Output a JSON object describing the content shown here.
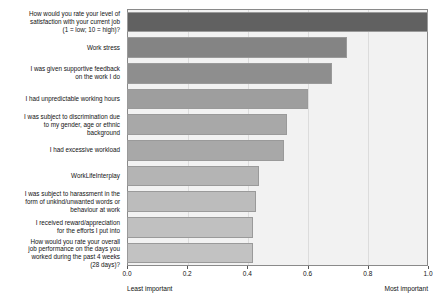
{
  "chart_data": {
    "type": "bar",
    "orientation": "horizontal",
    "title": "",
    "xlabel": "",
    "ylabel": "",
    "xlim": [
      0.0,
      1.0
    ],
    "xticks": [
      "0.0",
      "0.2",
      "0.4",
      "0.6",
      "0.8",
      "1.0"
    ],
    "xtick_values": [
      0.0,
      0.2,
      0.4,
      0.6,
      0.8,
      1.0
    ],
    "grid": true,
    "legend": "none",
    "axis_annotations": {
      "left": "Least important",
      "right": "Most important"
    },
    "categories": [
      "How would you rate your level of\nsatisfaction with your current job\n(1 = low; 10 = high)?",
      "Work stress",
      "I was given supportive feedback\non the work I do",
      "I had unpredictable working hours",
      "I was subject to discrimination due\nto my gender, age or ethnic\nbackground",
      "I had excessive workload",
      "WorkLifeInterplay",
      "I was subject to harassment in the\nform of unkind/unwanted words or\nbehaviour at work",
      "I received reward/appreciation\nfor the efforts I put into",
      "How would you rate your overall\njob performance on the days you\nworked during the past 4 weeks\n(28 days)?"
    ],
    "values": [
      1.0,
      0.73,
      0.68,
      0.6,
      0.53,
      0.52,
      0.44,
      0.43,
      0.42,
      0.42
    ],
    "bar_colors": [
      "#616161",
      "#848484",
      "#8e8e8e",
      "#9e9e9e",
      "#a8a8a8",
      "#a8a8a8",
      "#b4b4b4",
      "#bcbcbc",
      "#c0c0c0",
      "#c2c2c2"
    ],
    "plot_background": "#f2f2f2",
    "frame_color": "#8a8a8a"
  }
}
